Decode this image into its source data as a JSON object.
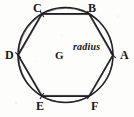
{
  "figure": {
    "background_color": "#fdfdfc",
    "ink_color": "#201d22",
    "width": 134,
    "height": 117
  },
  "geometry": {
    "circle": {
      "cx": 65.5,
      "cy": 55.0,
      "r": 47.5
    },
    "hexagon": {
      "sides": 6,
      "vertex_angles_deg": [
        0,
        300,
        240,
        180,
        120,
        60
      ],
      "vertices": [
        {
          "id": "A",
          "angle_deg": 0,
          "x": 113.0,
          "y": 55.0
        },
        {
          "id": "B",
          "angle_deg": 300,
          "x": 89.3,
          "y": 13.9
        },
        {
          "id": "C",
          "angle_deg": 240,
          "x": 41.8,
          "y": 13.9
        },
        {
          "id": "D",
          "angle_deg": 180,
          "x": 18.0,
          "y": 55.0
        },
        {
          "id": "E",
          "angle_deg": 120,
          "x": 41.8,
          "y": 96.1
        },
        {
          "id": "F",
          "angle_deg": 60,
          "x": 89.3,
          "y": 96.1
        }
      ]
    },
    "center": {
      "id": "G",
      "x": 65.5,
      "y": 55.0
    },
    "radius_segment": {
      "from": "G",
      "to": "A",
      "style": "dashed"
    }
  },
  "labels": {
    "vertices": [
      {
        "name": "A",
        "text": "A",
        "left": 120,
        "top": 49
      },
      {
        "name": "B",
        "text": "B",
        "left": 88,
        "top": 2
      },
      {
        "name": "C",
        "text": "C",
        "left": 33,
        "top": 2
      },
      {
        "name": "D",
        "text": "D",
        "left": 5,
        "top": 49
      },
      {
        "name": "E",
        "text": "E",
        "left": 36,
        "top": 100
      },
      {
        "name": "F",
        "text": "F",
        "left": 91,
        "top": 100
      }
    ],
    "center": {
      "name": "G",
      "text": "G",
      "left": 55,
      "top": 50
    },
    "radius": {
      "name": "radius",
      "text": "radius",
      "left": 73,
      "top": 42
    }
  }
}
